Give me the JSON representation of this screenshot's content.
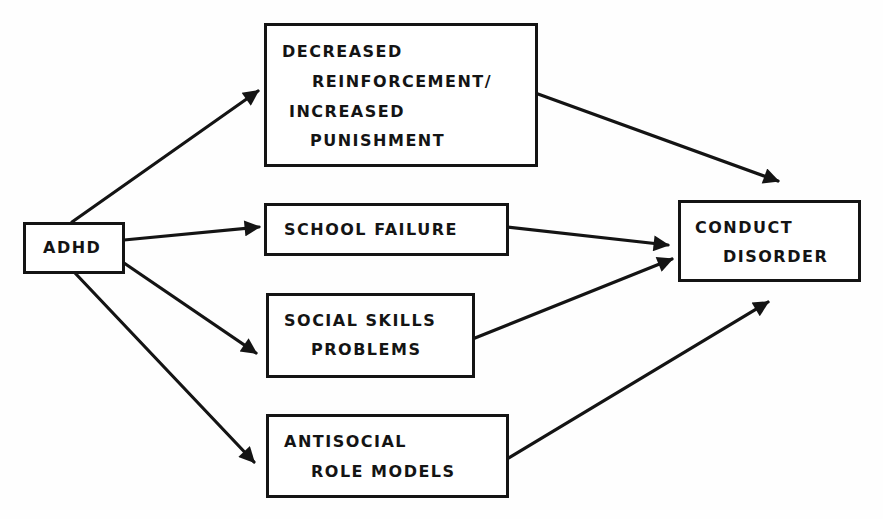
{
  "diagram": {
    "colors": {
      "ink": "#141414",
      "background": "#fefefe"
    },
    "nodes": {
      "adhd": {
        "lines": [
          "ADHD"
        ]
      },
      "reinforcement": {
        "lines": [
          "DECREASED",
          "REINFORCEMENT/",
          "INCREASED",
          "PUNISHMENT"
        ]
      },
      "school": {
        "lines": [
          "SCHOOL FAILURE"
        ]
      },
      "social": {
        "lines": [
          "SOCIAL SKILLS",
          "PROBLEMS"
        ]
      },
      "antisocial": {
        "lines": [
          "ANTISOCIAL",
          "ROLE MODELS"
        ]
      },
      "conduct": {
        "lines": [
          "CONDUCT",
          "DISORDER"
        ]
      }
    },
    "edges": [
      {
        "from": "ADHD",
        "to": "DECREASED REINFORCEMENT/INCREASED PUNISHMENT"
      },
      {
        "from": "ADHD",
        "to": "SCHOOL FAILURE"
      },
      {
        "from": "ADHD",
        "to": "SOCIAL SKILLS PROBLEMS"
      },
      {
        "from": "ADHD",
        "to": "ANTISOCIAL ROLE MODELS"
      },
      {
        "from": "DECREASED REINFORCEMENT/INCREASED PUNISHMENT",
        "to": "CONDUCT DISORDER"
      },
      {
        "from": "SCHOOL FAILURE",
        "to": "CONDUCT DISORDER"
      },
      {
        "from": "SOCIAL SKILLS PROBLEMS",
        "to": "CONDUCT DISORDER"
      },
      {
        "from": "ANTISOCIAL ROLE MODELS",
        "to": "CONDUCT DISORDER"
      }
    ]
  }
}
